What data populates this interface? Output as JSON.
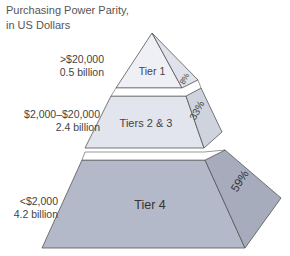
{
  "title": {
    "line1": "Purchasing Power Parity,",
    "line2": "in US Dollars"
  },
  "colors": {
    "top_front": "#eef0f5",
    "top_side": "#dfe2ea",
    "mid_front": "#e2e5ee",
    "mid_side": "#cfd3de",
    "base_front": "#b4b9c9",
    "base_side": "#a7acbd",
    "outline": "#555555"
  },
  "tiers": [
    {
      "name": "Tier 1",
      "range": ">$20,000",
      "population": "0.5 billion",
      "share": "8%"
    },
    {
      "name": "Tiers 2 & 3",
      "range": "$2,000–$20,000",
      "population": "2.4 billion",
      "share": "33%"
    },
    {
      "name": "Tier 4",
      "range": "<$2,000",
      "population": "4.2 billion",
      "share": "59%"
    }
  ]
}
